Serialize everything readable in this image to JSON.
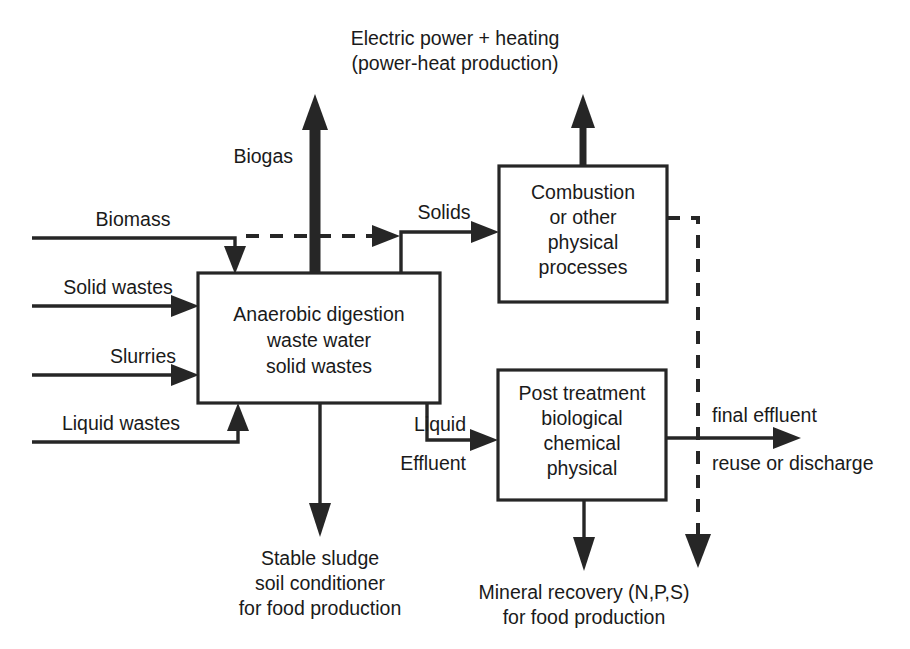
{
  "diagram": {
    "colors": {
      "line": "#262626",
      "box_fill": "#ffffff",
      "text": "#1a1a1a",
      "background": "#ffffff"
    },
    "boxes": {
      "digester": {
        "line1": "Anaerobic digestion",
        "line2": "waste water",
        "line3": "solid wastes"
      },
      "combustion": {
        "line1": "Combustion",
        "line2": "or other",
        "line3": "physical",
        "line4": "processes"
      },
      "post_treatment": {
        "line1": "Post treatment",
        "line2": "biological",
        "line3": "chemical",
        "line4": "physical"
      }
    },
    "inputs": {
      "biomass": "Biomass",
      "solid_wastes": "Solid wastes",
      "slurries": "Slurries",
      "liquid_wastes": "Liquid wastes"
    },
    "flows": {
      "biogas": "Biogas",
      "solids": "Solids",
      "liquid": "Liquid",
      "effluent": "Effluent"
    },
    "outputs": {
      "power_line1": "Electric power + heating",
      "power_line2": "(power-heat production)",
      "sludge_line1": "Stable sludge",
      "sludge_line2": "soil conditioner",
      "sludge_line3": "for food production",
      "mineral_line1": "Mineral recovery (N,P,S)",
      "mineral_line2": "for food production",
      "final_effluent": "final effluent",
      "reuse_or_discharge": "reuse or discharge"
    }
  }
}
